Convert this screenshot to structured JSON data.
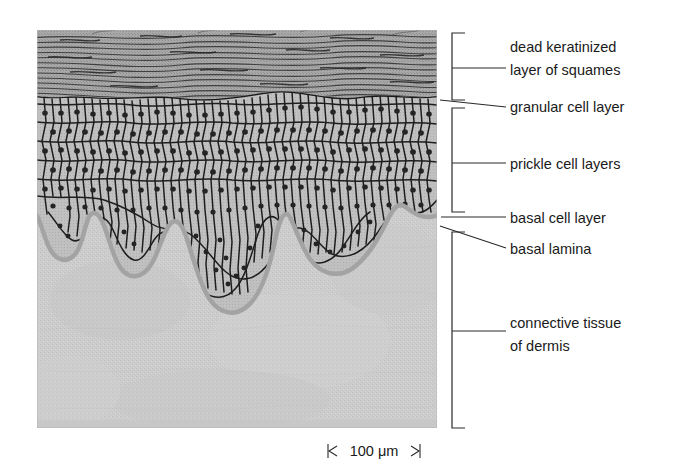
{
  "figure": {
    "background_color": "#ffffff"
  },
  "tissue": {
    "region": {
      "x": 37,
      "y": 30,
      "width": 400,
      "height": 398
    },
    "colors": {
      "keratin_layer": "#9a9a9a",
      "keratin_line": "#3b3b3b",
      "epidermis_cell_fill": "#bdbdbd",
      "cell_outline": "#1b1b1b",
      "nucleus": "#262626",
      "dermis": "#cbcbcb",
      "basal_lamina_shadow": "#a6a6a6",
      "outer_frame": "#8f8f8f"
    },
    "layers": [
      {
        "name": "dead keratinized layer of squames",
        "top": 30,
        "bottom": 97
      },
      {
        "name": "granular cell layer",
        "top": 97,
        "bottom": 106
      },
      {
        "name": "prickle cell layers",
        "top": 106,
        "bottom": 205
      },
      {
        "name": "basal cell layer",
        "top": 205,
        "bottom": 215
      },
      {
        "name": "connective tissue of dermis",
        "top": 215,
        "bottom": 428
      }
    ]
  },
  "labels": [
    {
      "id": "dead-keratinized-layer",
      "line1": "dead keratinized",
      "line2": "layer of squames",
      "text_x": 510,
      "text_y1": 52,
      "text_y2": 75,
      "leader": {
        "x1": 465,
        "y1": 68,
        "x2": 506,
        "y2": 68
      },
      "bracket": {
        "x": 452,
        "y_top": 33,
        "y_bottom": 100,
        "tip_y": 68,
        "tip_x2": 465
      }
    },
    {
      "id": "granular-cell-layer",
      "line1": "granular cell layer",
      "line2": "",
      "text_x": 510,
      "text_y1": 110,
      "text_y2": null,
      "leader": {
        "x1": 440,
        "y1": 100,
        "x2": 506,
        "y2": 106
      },
      "bracket": null
    },
    {
      "id": "prickle-cell-layers",
      "line1": "prickle cell layers",
      "line2": "",
      "text_x": 510,
      "text_y1": 168,
      "text_y2": null,
      "leader": {
        "x1": 465,
        "y1": 163,
        "x2": 506,
        "y2": 163
      },
      "bracket": {
        "x": 452,
        "y_top": 108,
        "y_bottom": 212,
        "tip_y": 163,
        "tip_x2": 465
      }
    },
    {
      "id": "basal-cell-layer",
      "line1": "basal cell layer",
      "line2": "",
      "text_x": 510,
      "text_y1": 222,
      "text_y2": null,
      "leader": {
        "x1": 441,
        "y1": 217,
        "x2": 506,
        "y2": 217
      },
      "bracket": null
    },
    {
      "id": "basal-lamina",
      "line1": "basal lamina",
      "line2": "",
      "text_x": 510,
      "text_y1": 253,
      "text_y2": null,
      "leader": {
        "x1": 440,
        "y1": 226,
        "x2": 506,
        "y2": 248
      },
      "bracket": null
    },
    {
      "id": "connective-tissue-of-dermis",
      "line1": "connective tissue",
      "line2": "of dermis",
      "text_x": 510,
      "text_y1": 327,
      "text_y2": 350,
      "leader": {
        "x1": 465,
        "y1": 331,
        "x2": 506,
        "y2": 331
      },
      "bracket": {
        "x": 452,
        "y_top": 232,
        "y_bottom": 428,
        "tip_y": 331,
        "tip_x2": 465
      }
    }
  ],
  "scale_bar": {
    "value": "100",
    "unit": "μm",
    "full_text": "100 μm",
    "x_left": 328,
    "x_right": 420,
    "y": 451,
    "tick_height": 14
  }
}
